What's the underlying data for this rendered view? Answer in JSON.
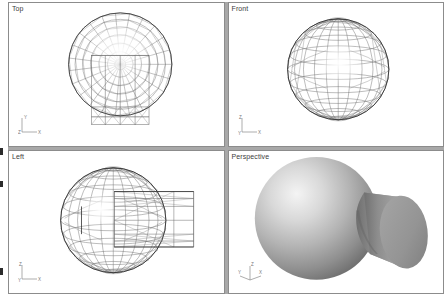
{
  "app": {
    "kind": "3d-modeling-viewport-layout",
    "background_color": "#ffffff",
    "divider_color": "#a8a8a8",
    "viewport_border_color": "#8c8c8c",
    "wireframe_color": "#5a5a5a",
    "shaded_light_color": "#efefef",
    "shaded_mid_color": "#9a9a9a",
    "shaded_dark_color": "#6f6f6f"
  },
  "viewports": [
    {
      "id": "top",
      "label": "Top",
      "display_mode": "wireframe",
      "objects": [
        "sphere",
        "cylinder"
      ],
      "axis_gizmo": {
        "up_label": "Y",
        "right_label": "X",
        "origin_label": "Z"
      }
    },
    {
      "id": "front",
      "label": "Front",
      "display_mode": "wireframe",
      "objects": [
        "sphere"
      ],
      "axis_gizmo": {
        "up_label": "Z",
        "right_label": "X",
        "origin_label": "Y"
      }
    },
    {
      "id": "left",
      "label": "Left",
      "display_mode": "wireframe",
      "objects": [
        "sphere",
        "cylinder"
      ],
      "axis_gizmo": {
        "up_label": "Z",
        "right_label": "X",
        "origin_label": "Y"
      }
    },
    {
      "id": "perspective",
      "label": "Perspective",
      "display_mode": "smooth-shaded",
      "objects": [
        "sphere",
        "cylinder"
      ],
      "axis_gizmo": {
        "up_label": "Z",
        "right_label": "X",
        "origin_label": "Y"
      }
    }
  ]
}
